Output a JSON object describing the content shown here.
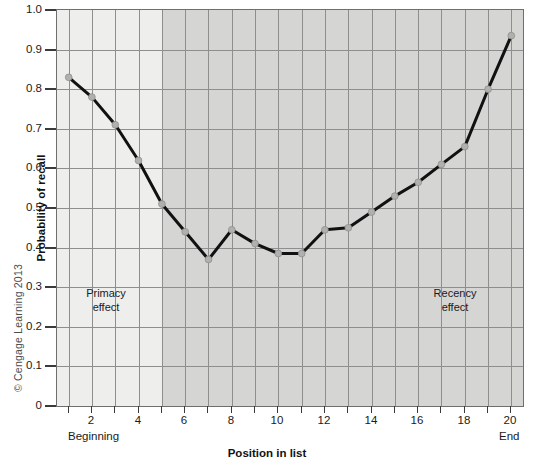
{
  "figure": {
    "copyright": "© Cengage Learning 2013"
  },
  "chart_data": {
    "type": "line",
    "title": "",
    "xlabel": "Position in list",
    "ylabel": "Probability of recall",
    "xlim": [
      0.5,
      20.5
    ],
    "ylim": [
      0,
      1.0
    ],
    "grid": true,
    "legend_position": "none",
    "x": [
      1,
      2,
      3,
      4,
      5,
      6,
      7,
      8,
      9,
      10,
      11,
      12,
      13,
      14,
      15,
      16,
      17,
      18,
      19,
      20
    ],
    "values": [
      0.83,
      0.78,
      0.71,
      0.62,
      0.51,
      0.44,
      0.37,
      0.445,
      0.41,
      0.385,
      0.385,
      0.445,
      0.45,
      0.49,
      0.53,
      0.565,
      0.61,
      0.655,
      0.8,
      0.935
    ],
    "series": [
      {
        "name": "Probability of recall",
        "values": [
          0.83,
          0.78,
          0.71,
          0.62,
          0.51,
          0.44,
          0.37,
          0.445,
          0.41,
          0.385,
          0.385,
          0.445,
          0.45,
          0.49,
          0.53,
          0.565,
          0.61,
          0.655,
          0.8,
          0.935
        ],
        "color": "#111111",
        "marker_color": "#b0b0ae"
      }
    ],
    "yticks": [
      0,
      0.1,
      0.2,
      0.3,
      0.4,
      0.5,
      0.6,
      0.7,
      0.8,
      0.9,
      1.0
    ],
    "ytick_labels": [
      "0",
      "0.1",
      "0.2",
      "0.3",
      "0.4",
      "0.5",
      "0.6",
      "0.7",
      "0.8",
      "0.9",
      "1.0"
    ],
    "xticks": [
      2,
      4,
      6,
      8,
      10,
      12,
      14,
      16,
      18,
      20
    ],
    "xtick_labels": [
      "2",
      "4",
      "6",
      "8",
      "10",
      "12",
      "14",
      "16",
      "18",
      "20"
    ],
    "xtick_all": [
      1,
      2,
      3,
      4,
      5,
      6,
      7,
      8,
      9,
      10,
      11,
      12,
      13,
      14,
      15,
      16,
      17,
      18,
      19,
      20
    ],
    "annotations": [
      {
        "name": "primacy",
        "line1": "Primacy",
        "line2": "effect",
        "x": 2.6,
        "y": 0.285
      },
      {
        "name": "recency",
        "line1": "Recency",
        "line2": "effect",
        "x": 17.6,
        "y": 0.285
      }
    ],
    "axis_end_labels": {
      "left": "Beginning",
      "right": "End"
    },
    "shading": {
      "light_region": {
        "from": 0.5,
        "to": 5.0,
        "color": "#eeeeec"
      },
      "dark_region": {
        "from": 5.0,
        "to": 20.5,
        "color": "#d5d5d3"
      }
    },
    "colors": {
      "line": "#111111",
      "marker": "#b0b0ae",
      "grid": "#8e8e8e",
      "frame": "#6f6f6f",
      "text": "#1a1a1a"
    }
  }
}
